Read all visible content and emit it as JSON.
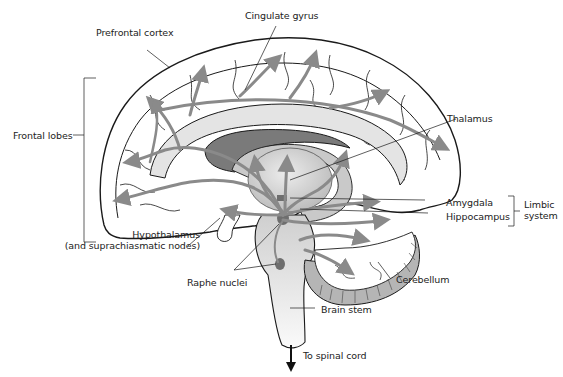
{
  "diagram": {
    "type": "anatomical-illustration",
    "colors": {
      "outline": "#1a1a1a",
      "pathway_arrow": "#8a8a8a",
      "limbic_fill": "#c9c9c9",
      "ventricle_fill": "#7a7a7a",
      "thalamus_fill": "#dcdcdc",
      "brainstem_fill": "#e6e6e6",
      "cerebellum_fill": "#b0b0b0",
      "raphe_fill": "#6e6e6e"
    },
    "labels": {
      "cingulate_gyrus": "Cingulate gyrus",
      "prefrontal_cortex": "Prefrontal cortex",
      "frontal_lobes": "Frontal lobes",
      "thalamus": "Thalamus",
      "amygdala": "Amygdala",
      "hippocampus": "Hippocampus",
      "limbic_system_line1": "Limbic",
      "limbic_system_line2": "system",
      "hypothalamus_line1": "Hypothalamus",
      "hypothalamus_line2": "(and suprachiasmatic nodes)",
      "raphe_nuclei": "Raphe nuclei",
      "cerebellum": "Cerebellum",
      "brain_stem": "Brain stem",
      "to_spinal_cord": "To spinal cord"
    }
  }
}
